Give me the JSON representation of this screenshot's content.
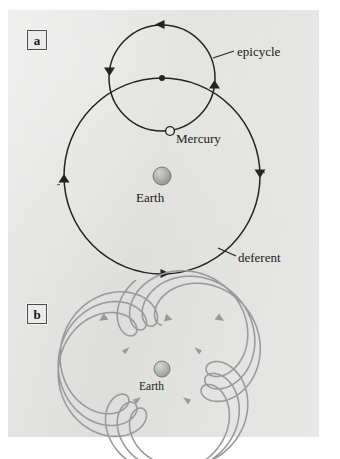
{
  "figure": {
    "background_color": "#e2e2e0",
    "ink_color": "#23231f",
    "pale_ink_color": "#9a9a9e",
    "panels": [
      {
        "id": "a",
        "label": "a",
        "caption_labels": [
          "epicycle",
          "Mercury",
          "Earth",
          "deferent"
        ]
      },
      {
        "id": "b",
        "label": "b",
        "caption_labels": [
          "Earth"
        ]
      }
    ]
  },
  "panel_a": {
    "label": "a",
    "labels": {
      "epicycle": "epicycle",
      "mercury": "Mercury",
      "earth": "Earth",
      "deferent": "deferent"
    },
    "earth": {
      "cx": 162,
      "cy": 176,
      "r": 9,
      "color": "#a9a9a5"
    },
    "mercury": {
      "cx": 170,
      "cy": 131,
      "r": 4.4,
      "fill": "#e8e8e6"
    },
    "deferent": {
      "cx": 162,
      "cy": 176,
      "r": 98,
      "direction": "counterclockwise"
    },
    "epicycle": {
      "cx": 162,
      "cy": 78,
      "r": 53,
      "direction": "counterclockwise"
    },
    "epicycle_center_dot": {
      "cx": 162,
      "cy": 78,
      "r": 3
    }
  },
  "panel_b": {
    "label": "b",
    "labels": {
      "earth": "Earth"
    },
    "earth": {
      "cx": 162,
      "cy": 369,
      "r": 8,
      "color": "#b0b0ac"
    },
    "path": {
      "type": "epitrochoid",
      "description": "retrograde looping path traced by Mercury around the Earth",
      "loops": 3,
      "loop_positions": [
        "top",
        "lower-left",
        "lower-right"
      ],
      "R": 56,
      "r": 18,
      "d": 30,
      "direction": "counterclockwise"
    }
  },
  "chart_data": {
    "type": "line",
    "xlabel": "",
    "ylabel": "",
    "series": [
      {
        "name": "deferent",
        "shape": "circle",
        "center": [
          162,
          176
        ],
        "radius": 98,
        "direction": "counterclockwise",
        "arrow_positions": [
          "left",
          "right",
          "bottom"
        ]
      },
      {
        "name": "epicycle",
        "shape": "circle",
        "center": [
          162,
          78
        ],
        "radius": 53,
        "direction": "counterclockwise",
        "arrow_positions": [
          "top",
          "left",
          "right"
        ]
      },
      {
        "name": "mercury-apparent-path",
        "shape": "epitrochoid",
        "center": [
          162,
          369
        ],
        "R": 56,
        "r": 18,
        "d": 30,
        "loops": 3,
        "direction": "counterclockwise"
      }
    ],
    "points": [
      {
        "name": "Earth",
        "panel": "a",
        "x": 162,
        "y": 176
      },
      {
        "name": "Mercury",
        "panel": "a",
        "x": 170,
        "y": 131
      },
      {
        "name": "epicycle-center",
        "panel": "a",
        "x": 162,
        "y": 78
      },
      {
        "name": "Earth",
        "panel": "b",
        "x": 162,
        "y": 369
      }
    ],
    "grid": false,
    "legend": "none"
  }
}
